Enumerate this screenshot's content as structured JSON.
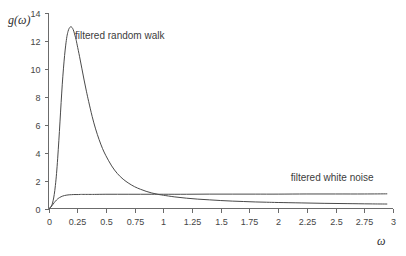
{
  "chart_data": {
    "type": "line",
    "title": "",
    "xlabel": "ω",
    "ylabel": "g(ω)",
    "xlim": [
      0,
      3
    ],
    "ylim": [
      0,
      14
    ],
    "grid": false,
    "legend_position": "inline-annotations",
    "x_ticks": [
      "0",
      "0.25",
      "0.5",
      "0.75",
      "1",
      "1.25",
      "1.5",
      "1.75",
      "2",
      "2.25",
      "2.5",
      "2.75",
      "3"
    ],
    "x_tick_values": [
      0,
      0.25,
      0.5,
      0.75,
      1,
      1.25,
      1.5,
      1.75,
      2,
      2.25,
      2.5,
      2.75,
      3
    ],
    "y_ticks": [
      "0",
      "2",
      "4",
      "6",
      "8",
      "10",
      "12",
      "14"
    ],
    "y_tick_values": [
      0,
      2,
      4,
      6,
      8,
      10,
      12,
      14
    ],
    "annotations": [
      {
        "text": "filtered random walk",
        "x": 0.62,
        "y": 12.15
      },
      {
        "text": "filtered white noise",
        "x": 2.47,
        "y": 1.95
      }
    ],
    "series": [
      {
        "name": "filtered random walk",
        "color": "#4a4a4a",
        "x": [
          0.0,
          0.01,
          0.02,
          0.03,
          0.04,
          0.05,
          0.06,
          0.07,
          0.08,
          0.09,
          0.1,
          0.11,
          0.12,
          0.13,
          0.14,
          0.15,
          0.16,
          0.17,
          0.18,
          0.19,
          0.2,
          0.21,
          0.22,
          0.23,
          0.24,
          0.25,
          0.27,
          0.29,
          0.31,
          0.33,
          0.35,
          0.38,
          0.41,
          0.44,
          0.47,
          0.5,
          0.55,
          0.6,
          0.65,
          0.7,
          0.75,
          0.8,
          0.85,
          0.9,
          0.95,
          1.0,
          1.1,
          1.2,
          1.3,
          1.4,
          1.5,
          1.6,
          1.7,
          1.8,
          1.9,
          2.0,
          2.2,
          2.4,
          2.6,
          2.8,
          2.95
        ],
        "y": [
          0.0,
          0.02,
          0.1,
          0.26,
          0.55,
          1.0,
          1.65,
          2.5,
          3.6,
          4.85,
          6.2,
          7.6,
          8.9,
          10.0,
          10.95,
          11.7,
          12.3,
          12.68,
          12.9,
          13.0,
          13.0,
          12.9,
          12.7,
          12.4,
          12.1,
          11.7,
          10.9,
          10.05,
          9.2,
          8.4,
          7.65,
          6.6,
          5.7,
          4.95,
          4.3,
          3.78,
          3.05,
          2.5,
          2.1,
          1.8,
          1.56,
          1.38,
          1.23,
          1.11,
          1.02,
          0.95,
          0.83,
          0.74,
          0.67,
          0.62,
          0.57,
          0.53,
          0.5,
          0.47,
          0.45,
          0.43,
          0.4,
          0.37,
          0.35,
          0.33,
          0.32
        ]
      },
      {
        "name": "filtered white noise",
        "color": "#4a4a4a",
        "x": [
          0.0,
          0.01,
          0.02,
          0.03,
          0.04,
          0.05,
          0.06,
          0.07,
          0.08,
          0.09,
          0.1,
          0.12,
          0.14,
          0.16,
          0.18,
          0.2,
          0.22,
          0.24,
          0.26,
          0.28,
          0.3,
          0.35,
          0.4,
          0.5,
          0.6,
          0.7,
          0.8,
          0.9,
          1.0,
          1.2,
          1.4,
          1.6,
          1.8,
          2.0,
          2.25,
          2.5,
          2.75,
          2.95
        ],
        "y": [
          0.0,
          0.03,
          0.1,
          0.2,
          0.31,
          0.42,
          0.52,
          0.61,
          0.69,
          0.75,
          0.8,
          0.88,
          0.93,
          0.96,
          0.98,
          0.99,
          1.0,
          1.0,
          1.0,
          1.01,
          1.01,
          1.01,
          1.01,
          1.02,
          1.02,
          1.02,
          1.02,
          1.02,
          1.02,
          1.02,
          1.03,
          1.03,
          1.03,
          1.03,
          1.04,
          1.04,
          1.04,
          1.05
        ]
      }
    ]
  }
}
